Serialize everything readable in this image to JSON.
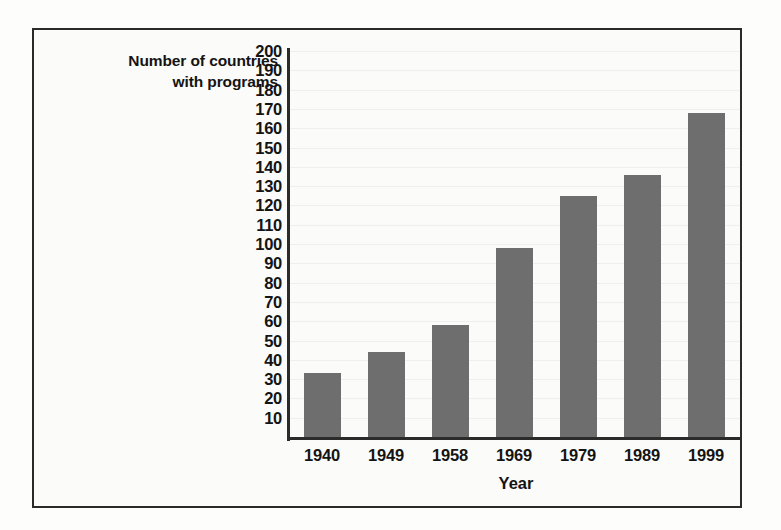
{
  "figure": {
    "frame_color": "#2a2a2a",
    "background_color": "#fbfbfa"
  },
  "chart_data": {
    "type": "bar",
    "title": "",
    "xlabel": "Year",
    "ylabel": "Number of countries with programs",
    "ylabel_lines": [
      "Number of countries",
      "with programs"
    ],
    "categories": [
      "1940",
      "1949",
      "1958",
      "1969",
      "1979",
      "1989",
      "1999"
    ],
    "values": [
      33,
      44,
      58,
      98,
      125,
      136,
      168
    ],
    "ylim": [
      0,
      200
    ],
    "ytick_step": 10,
    "ytick_labels": [
      "200",
      "190",
      "180",
      "170",
      "160",
      "150",
      "140",
      "130",
      "120",
      "110",
      "100",
      "90",
      "80",
      "70",
      "60",
      "50",
      "40",
      "30",
      "20",
      "10"
    ],
    "ytick_values": [
      200,
      190,
      180,
      170,
      160,
      150,
      140,
      130,
      120,
      110,
      100,
      90,
      80,
      70,
      60,
      50,
      40,
      30,
      20,
      10
    ],
    "grid": true,
    "legend": null,
    "series_color": "#6e6e6e",
    "axis_color": "#2b2b2b"
  }
}
